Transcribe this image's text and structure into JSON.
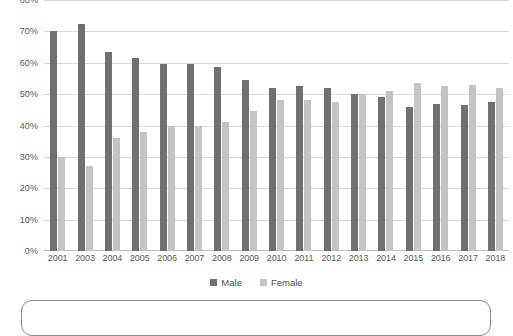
{
  "chart_data": {
    "type": "bar",
    "title": "",
    "subtitle": "",
    "xlabel": "",
    "ylabel": "",
    "ylim": [
      0,
      80
    ],
    "grid": true,
    "legend_position": "bottom",
    "y_ticks": [
      "0%",
      "10%",
      "20%",
      "30%",
      "40%",
      "50%",
      "60%",
      "70%",
      "80%"
    ],
    "y_tick_values": [
      0,
      10,
      20,
      30,
      40,
      50,
      60,
      70,
      80
    ],
    "categories": [
      "2001",
      "2003",
      "2004",
      "2005",
      "2006",
      "2007",
      "2008",
      "2009",
      "2010",
      "2011",
      "2012",
      "2013",
      "2014",
      "2015",
      "2016",
      "2017",
      "2018"
    ],
    "series": [
      {
        "name": "Male",
        "color": "#70706f",
        "values": [
          70,
          72.5,
          63.5,
          61.5,
          59.5,
          59.5,
          58.5,
          54.5,
          52,
          52.5,
          52,
          50,
          49,
          46,
          47,
          46.5,
          47.5
        ]
      },
      {
        "name": "Female",
        "color": "#c4c4c3",
        "values": [
          30,
          27,
          36,
          38,
          40,
          40,
          41,
          44.5,
          48,
          48,
          47.5,
          50,
          51,
          53.5,
          52.5,
          53,
          52
        ]
      }
    ]
  },
  "legend": {
    "items": [
      {
        "label": "Male",
        "color": "#70706f"
      },
      {
        "label": "Female",
        "color": "#c4c4c3"
      }
    ]
  },
  "colors": {
    "male": "#70706f",
    "female": "#c4c4c3",
    "gridline": "#d9d9d9",
    "axis_text": "#595959",
    "panel_border": "#8c8c8c"
  }
}
